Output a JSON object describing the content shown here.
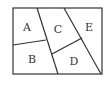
{
  "diagram": {
    "type": "partitioned-rectangle",
    "colors": {
      "line": "#333333",
      "background": "#ffffff",
      "text": "#333333"
    },
    "regions": [
      {
        "id": "A",
        "label": "A",
        "x": 26,
        "y": 28
      },
      {
        "id": "B",
        "label": "B",
        "x": 32,
        "y": 62
      },
      {
        "id": "C",
        "label": "C",
        "x": 58,
        "y": 33
      },
      {
        "id": "D",
        "label": "D",
        "x": 74,
        "y": 64
      },
      {
        "id": "E",
        "label": "E",
        "x": 89,
        "y": 30
      }
    ]
  }
}
